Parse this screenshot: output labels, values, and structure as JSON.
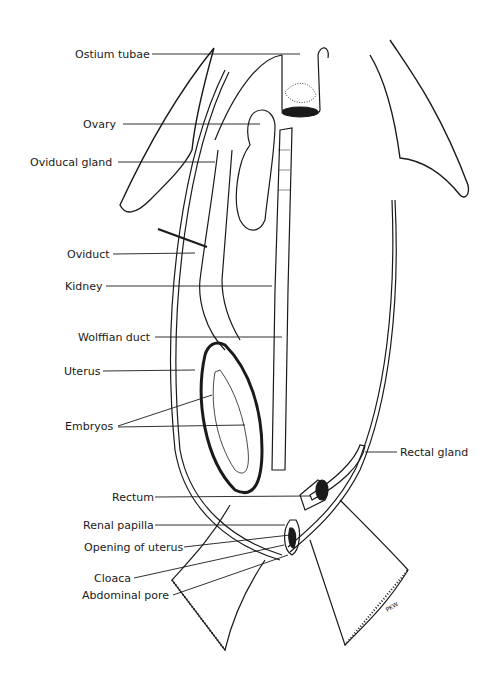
{
  "diagram": {
    "labels": [
      {
        "id": "ostium-tubae",
        "text": "Ostium tubae",
        "x": 75,
        "y": 48
      },
      {
        "id": "ovary",
        "text": "Ovary",
        "x": 83,
        "y": 118
      },
      {
        "id": "oviducal-gland",
        "text": "Oviducal gland",
        "x": 30,
        "y": 156
      },
      {
        "id": "oviduct",
        "text": "Oviduct",
        "x": 67,
        "y": 248
      },
      {
        "id": "kidney",
        "text": "Kidney",
        "x": 65,
        "y": 280
      },
      {
        "id": "wolffian-duct",
        "text": "Wolffian duct",
        "x": 78,
        "y": 330
      },
      {
        "id": "uterus",
        "text": "Uterus",
        "x": 64,
        "y": 364
      },
      {
        "id": "embryos",
        "text": "Embryos",
        "x": 65,
        "y": 421
      },
      {
        "id": "rectal-gland",
        "text": "Rectal gland",
        "x": 400,
        "y": 446
      },
      {
        "id": "rectum",
        "text": "Rectum",
        "x": 112,
        "y": 491
      },
      {
        "id": "renal-papilla",
        "text": "Renal papilla",
        "x": 83,
        "y": 519
      },
      {
        "id": "opening-of-uterus",
        "text": "Opening of uterus",
        "x": 84,
        "y": 540
      },
      {
        "id": "cloaca",
        "text": "Cloaca",
        "x": 94,
        "y": 572
      },
      {
        "id": "abdominal-pore",
        "text": "Abdominal pore",
        "x": 82,
        "y": 589
      }
    ],
    "signature": "PKW"
  }
}
